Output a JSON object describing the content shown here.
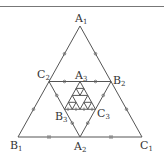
{
  "diagram": {
    "type": "nested-medial-triangles",
    "stroke_color": "#555555",
    "labels": {
      "A1": {
        "base": "A",
        "sub": "1"
      },
      "B1": {
        "base": "B",
        "sub": "1"
      },
      "C1": {
        "base": "C",
        "sub": "1"
      },
      "A2": {
        "base": "A",
        "sub": "2"
      },
      "B2": {
        "base": "B",
        "sub": "2"
      },
      "C2": {
        "base": "C",
        "sub": "2"
      },
      "A3": {
        "base": "A",
        "sub": "3"
      },
      "B3": {
        "base": "B",
        "sub": "3"
      },
      "C3": {
        "base": "C",
        "sub": "3"
      }
    },
    "points": {
      "A1": [
        80,
        26
      ],
      "B1": [
        18,
        137
      ],
      "C1": [
        142,
        137
      ],
      "A2": [
        80,
        137
      ],
      "B2": [
        111,
        81.5
      ],
      "C2": [
        49,
        81.5
      ],
      "A3": [
        80,
        81.5
      ],
      "B3": [
        64.5,
        109.25
      ],
      "C3": [
        95.5,
        109.25
      ]
    },
    "tick_marks": {
      "single_circle": "outer slanted sides and middle triangle sides",
      "double_bar": "base segments B1A2 and A2C1"
    }
  }
}
